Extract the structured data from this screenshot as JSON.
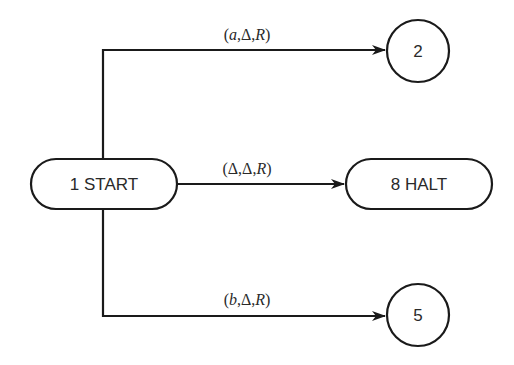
{
  "diagram": {
    "type": "turing-machine-state-diagram",
    "nodes": {
      "start": {
        "id": "1",
        "label": "1 START",
        "shape": "rounded-rect"
      },
      "halt": {
        "id": "8",
        "label": "8 HALT",
        "shape": "rounded-rect"
      },
      "state2": {
        "id": "2",
        "label": "2",
        "shape": "circle"
      },
      "state5": {
        "id": "5",
        "label": "5",
        "shape": "circle"
      }
    },
    "edges": {
      "to_state2": {
        "from": "1",
        "to": "2",
        "label_open": "(",
        "read": "a",
        "write": "Δ",
        "move": "R",
        "label_close": ")",
        "sep": ","
      },
      "to_halt": {
        "from": "1",
        "to": "8",
        "label_open": "(",
        "read": "Δ",
        "write": "Δ",
        "move": "R",
        "label_close": ")",
        "sep": ","
      },
      "to_state5": {
        "from": "1",
        "to": "5",
        "label_open": "(",
        "read": "b",
        "write": "Δ",
        "move": "R",
        "label_close": ")",
        "sep": ","
      }
    },
    "colors": {
      "stroke": "#1a1a1a",
      "text": "#2a2a2a",
      "background": "#ffffff"
    }
  }
}
